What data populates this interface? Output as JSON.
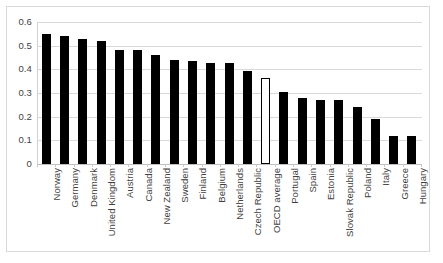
{
  "chart_data": {
    "type": "bar",
    "title": "",
    "subtitle": "",
    "xlabel": "",
    "ylabel": "",
    "ylim": [
      0,
      0.6
    ],
    "ytick_labels": [
      "0.6",
      "0.5",
      "0.4",
      "0.3",
      "0.2",
      "0.1",
      "0"
    ],
    "ytick_values": [
      0.6,
      0.5,
      0.4,
      0.3,
      0.2,
      0.1,
      0
    ],
    "grid": true,
    "legend": null,
    "legend_position": "none",
    "bar_color": "#000000",
    "highlight_color": "#ffffff",
    "highlight_border_color": "#000000",
    "gridline_color": "#d9d9d9",
    "categories": [
      "Norway",
      "Germany",
      "Denmark",
      "United Kingdom",
      "Austria",
      "Canada",
      "New Zealand",
      "Sweden",
      "Finland",
      "Belgium",
      "Netherlands",
      "Czech Republic",
      "OECD average",
      "Portugal",
      "Spain",
      "Estonia",
      "Slovak Republic",
      "Poland",
      "Italy",
      "Greece",
      "Hungary"
    ],
    "values": [
      0.55,
      0.54,
      0.53,
      0.52,
      0.48,
      0.48,
      0.46,
      0.44,
      0.435,
      0.425,
      0.425,
      0.395,
      0.365,
      0.305,
      0.28,
      0.27,
      0.27,
      0.24,
      0.19,
      0.12,
      0.12
    ],
    "highlighted_categories": [
      "OECD average"
    ]
  }
}
